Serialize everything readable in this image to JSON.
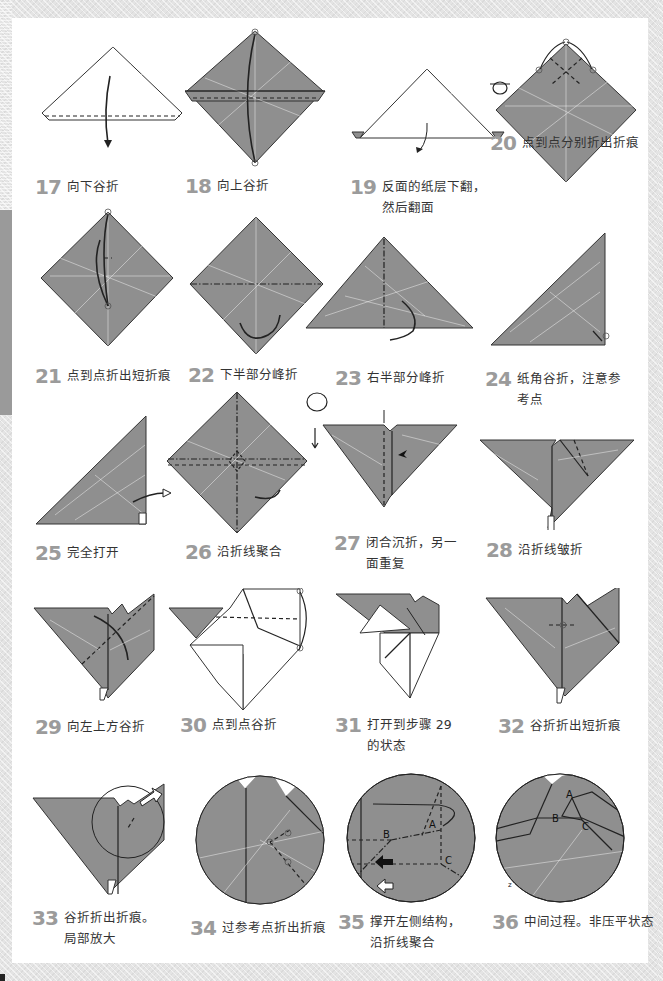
{
  "page": {
    "colors": {
      "paper_fill": "#8f8f8f",
      "step_number": "#9b9b9b",
      "caption_text": "#333333",
      "background": "#e4e4e4",
      "page": "#ffffff"
    }
  },
  "steps": [
    {
      "number": "17",
      "text_line1": "向下谷折",
      "text_line2": ""
    },
    {
      "number": "18",
      "text_line1": "向上谷折",
      "text_line2": ""
    },
    {
      "number": "19",
      "text_line1": "反面的纸层下翻，",
      "text_line2": "然后翻面"
    },
    {
      "number": "20",
      "text_line1": "点到点分别折出折痕",
      "text_line2": ""
    },
    {
      "number": "21",
      "text_line1": "点到点折出短折痕",
      "text_line2": ""
    },
    {
      "number": "22",
      "text_line1": "下半部分峰折",
      "text_line2": ""
    },
    {
      "number": "23",
      "text_line1": "右半部分峰折",
      "text_line2": ""
    },
    {
      "number": "24",
      "text_line1": "纸角谷折，注意参",
      "text_line2": "考点"
    },
    {
      "number": "25",
      "text_line1": "完全打开",
      "text_line2": ""
    },
    {
      "number": "26",
      "text_line1": "沿折线聚合",
      "text_line2": ""
    },
    {
      "number": "27",
      "text_line1": "闭合沉折，另一",
      "text_line2": "面重复"
    },
    {
      "number": "28",
      "text_line1": "沿折线皱折",
      "text_line2": ""
    },
    {
      "number": "29",
      "text_line1": "向左上方谷折",
      "text_line2": ""
    },
    {
      "number": "30",
      "text_line1": "点到点谷折",
      "text_line2": ""
    },
    {
      "number": "31",
      "text_line1": "打开到步骤 29",
      "text_line2": "的状态"
    },
    {
      "number": "32",
      "text_line1": "谷折折出短折痕",
      "text_line2": ""
    },
    {
      "number": "33",
      "text_line1": "谷折折出折痕。",
      "text_line2": "局部放大"
    },
    {
      "number": "34",
      "text_line1": "过参考点折出折痕",
      "text_line2": ""
    },
    {
      "number": "35",
      "text_line1": "撑开左侧结构，",
      "text_line2": "沿折线聚合"
    },
    {
      "number": "36",
      "text_line1": "中间过程。非压平状态",
      "text_line2": ""
    }
  ],
  "diagram_labels": {
    "step35": {
      "a": "A",
      "b": "B",
      "c": "C"
    },
    "step36": {
      "a": "A",
      "b": "B",
      "c": "C",
      "z": "z"
    }
  }
}
